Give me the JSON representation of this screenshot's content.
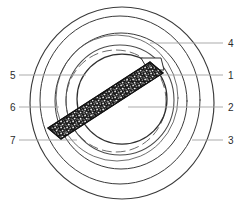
{
  "figure": {
    "type": "technical-line-drawing",
    "background_color": "#ffffff",
    "line_color": "#3a3a3a",
    "leader_line_color": "#9a9a9a",
    "text_color": "#2b2b2b",
    "hatch_color": "#1a1a1a",
    "callouts": {
      "left": [
        {
          "id": "callout-5",
          "label": "5",
          "text_x": 10,
          "text_y": 78,
          "line_x1": 19,
          "line_x2": 86,
          "line_y": 75
        },
        {
          "id": "callout-6",
          "label": "6",
          "text_x": 10,
          "text_y": 110,
          "line_x1": 19,
          "line_x2": 59,
          "line_y": 107
        },
        {
          "id": "callout-7",
          "label": "7",
          "text_x": 10,
          "text_y": 143,
          "line_x1": 19,
          "line_x2": 77,
          "line_y": 140
        }
      ],
      "right": [
        {
          "id": "callout-4",
          "label": "4",
          "text_x": 227,
          "text_y": 46,
          "line_x1": 150,
          "line_x2": 223,
          "line_y": 43
        },
        {
          "id": "callout-1",
          "label": "1",
          "text_x": 227,
          "text_y": 78,
          "line_x1": 147,
          "line_x2": 223,
          "line_y": 75
        },
        {
          "id": "callout-2",
          "label": "2",
          "text_x": 227,
          "text_y": 110,
          "line_x1": 128,
          "line_x2": 223,
          "line_y": 107
        },
        {
          "id": "callout-3",
          "label": "3",
          "text_x": 227,
          "text_y": 143,
          "line_x1": 192,
          "line_x2": 223,
          "line_y": 140
        }
      ]
    },
    "circles": [
      {
        "id": "outer-ring-1",
        "cx": 122,
        "cy": 103,
        "rx": 92,
        "ry": 96,
        "stroke_width": 1.1,
        "dash": "none"
      },
      {
        "id": "outer-ring-2",
        "cx": 120,
        "cy": 100,
        "rx": 80,
        "ry": 84,
        "stroke_width": 1.0,
        "dash": "none"
      },
      {
        "id": "mid-ring-1",
        "cx": 121,
        "cy": 101,
        "rx": 66,
        "ry": 68,
        "stroke_width": 1.0,
        "dash": "none"
      },
      {
        "id": "mid-ring-2",
        "cx": 118,
        "cy": 99,
        "rx": 61,
        "ry": 63,
        "stroke_width": 0.9,
        "dash": "none"
      },
      {
        "id": "inner-ring-1",
        "cx": 120,
        "cy": 100,
        "rx": 54,
        "ry": 55,
        "stroke_width": 1.1,
        "dash": "none"
      },
      {
        "id": "inner-ring-dashed",
        "cx": 116,
        "cy": 101,
        "rx": 50,
        "ry": 51,
        "stroke_width": 0.9,
        "dash": "7,4"
      },
      {
        "id": "core-ring",
        "cx": 122,
        "cy": 99,
        "rx": 45,
        "ry": 45,
        "stroke_width": 1.2,
        "dash": "none"
      }
    ],
    "diagonal_bar": {
      "id": "stippled-bar",
      "top_face_points": "150,62 160,62 163,72 153,72",
      "body_points": "48,128 150,62 163,73 61,139",
      "fill": "#151515",
      "speckle_count": 900,
      "highlight_fill": "#ffffff"
    }
  }
}
